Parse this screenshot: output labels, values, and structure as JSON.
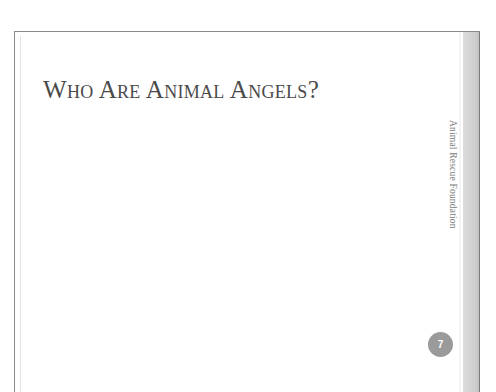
{
  "slide": {
    "title": "Who Are Animal Angels?",
    "footer": "Animal Rescue Foundation",
    "page_number": "7"
  },
  "colors": {
    "title": "#4a4a4a",
    "page_badge": "#9a9a9a",
    "border": "#8a8a8a"
  }
}
